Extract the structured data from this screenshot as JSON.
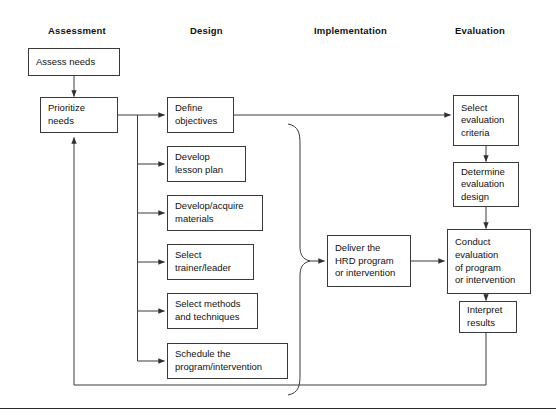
{
  "figure": {
    "background": "#ffffff",
    "line_color": "#3a3a3a",
    "text_color": "#111111"
  },
  "columns": [
    {
      "key": "assessment",
      "label": "Assessment"
    },
    {
      "key": "design",
      "label": "Design"
    },
    {
      "key": "implementation",
      "label": "Implementation"
    },
    {
      "key": "evaluation",
      "label": "Evaluation"
    }
  ],
  "nodes": {
    "assess_needs": {
      "label": "Assess needs"
    },
    "prioritize_needs": {
      "label": "Prioritize\nneeds"
    },
    "define_objectives": {
      "label": "Define\nobjectives"
    },
    "develop_lesson_plan": {
      "label": "Develop\nlesson plan"
    },
    "develop_materials": {
      "label": "Develop/acquire\nmaterials"
    },
    "select_trainer": {
      "label": "Select\ntrainer/leader"
    },
    "select_methods": {
      "label": "Select methods\nand techniques"
    },
    "schedule_program": {
      "label": "Schedule the\nprogram/intervention"
    },
    "deliver_program": {
      "label": "Deliver the\nHRD program\nor intervention"
    },
    "select_criteria": {
      "label": "Select\nevaluation\ncriteria"
    },
    "determine_design": {
      "label": "Determine\nevaluation\ndesign"
    },
    "conduct_evaluation": {
      "label": "Conduct\nevaluation\nof program\nor intervention"
    },
    "interpret_results": {
      "label": "Interpret\nresults"
    }
  }
}
